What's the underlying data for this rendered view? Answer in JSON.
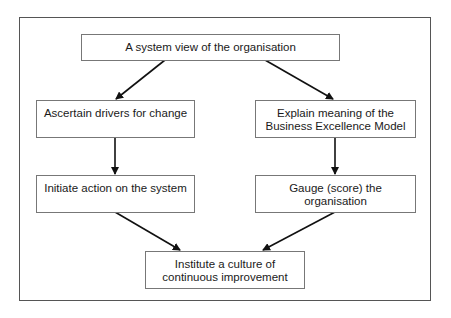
{
  "diagram": {
    "nodes": {
      "top": {
        "label": "A system view of the organisation"
      },
      "left1": {
        "label": "Ascertain drivers for change"
      },
      "right1": {
        "line1": "Explain meaning of the",
        "line2": "Business Excellence Model"
      },
      "left2": {
        "label": "Initiate action on the system"
      },
      "right2": {
        "line1": "Gauge (score) the",
        "line2": "organisation"
      },
      "bottom": {
        "line1": "Institute a culture of",
        "line2": "continuous improvement"
      }
    },
    "edges": [
      {
        "from": "top",
        "to": "left1"
      },
      {
        "from": "top",
        "to": "right1"
      },
      {
        "from": "left1",
        "to": "left2"
      },
      {
        "from": "right1",
        "to": "right2"
      },
      {
        "from": "left2",
        "to": "bottom"
      },
      {
        "from": "right2",
        "to": "bottom"
      }
    ]
  }
}
